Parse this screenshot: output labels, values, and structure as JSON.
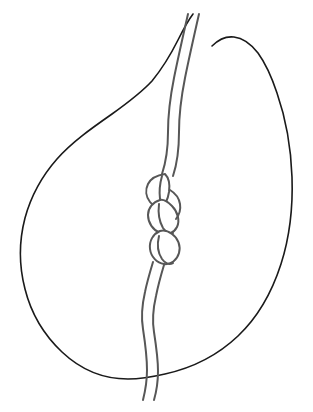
{
  "figure": {
    "title": "Knotted cord passing through a teardrop outline",
    "background_color": "#ffffff",
    "canvas": {
      "width": 313,
      "height": 412
    },
    "elements": {
      "outline": {
        "name": "teardrop-outline",
        "stroke_color": "#1a1a1a",
        "stroke_width": 1.6,
        "fill": "none",
        "shape": "teardrop"
      },
      "cord": {
        "name": "knotted-cord",
        "stroke_color": "#575757",
        "stroke_width": 2.0,
        "fill": "none",
        "style": "double-line rope",
        "top_exit_x": 193,
        "top_exit_y": 14,
        "bottom_exit_x": 147,
        "bottom_exit_y": 400
      },
      "knot": {
        "name": "chain-knot",
        "loop_count": 3,
        "stroke_color": "#575757",
        "fill": "#ffffff",
        "center_x": 164,
        "center_y": 212,
        "top_y": 172,
        "bottom_y": 262
      }
    }
  }
}
